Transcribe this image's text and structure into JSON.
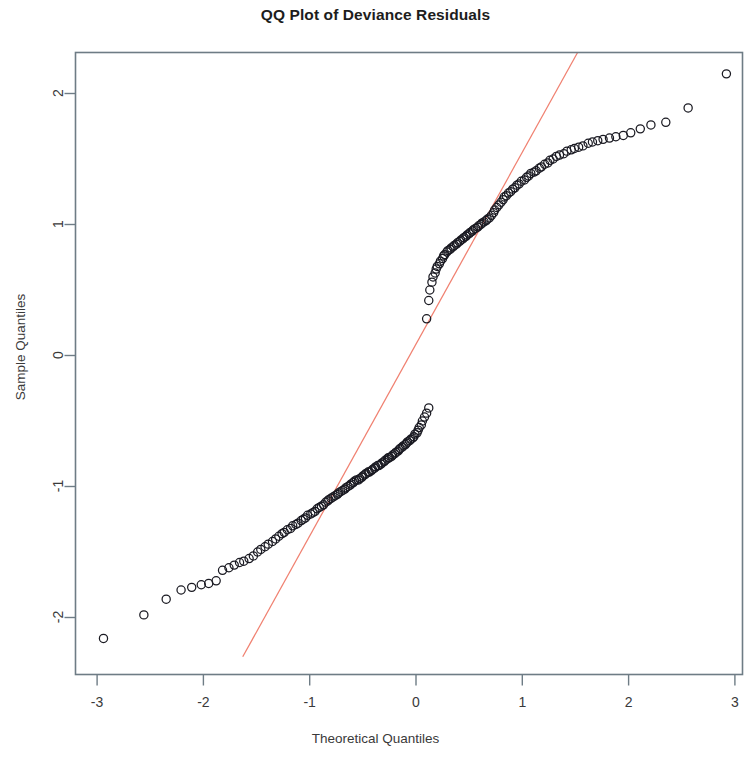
{
  "chart_data": {
    "type": "scatter",
    "title": "QQ Plot of Deviance Residuals",
    "xlabel": "Theoretical Quantiles",
    "ylabel": "Sample Quantiles",
    "xlim": [
      -3.2,
      3.15
    ],
    "ylim": [
      -2.3,
      2.32
    ],
    "xticks": [
      -3,
      -2,
      -1,
      0,
      1,
      2,
      3
    ],
    "xtick_labels": [
      "-3",
      "-2",
      "-1",
      "0",
      "1",
      "2",
      "3"
    ],
    "yticks": [
      -2,
      -1,
      0,
      1,
      2
    ],
    "ytick_labels": [
      "-2",
      "-1",
      "0",
      "1",
      "2"
    ],
    "grid": false,
    "legend": "none",
    "marker": "open-circle",
    "marker_color": "#1a1a22",
    "frame_color": "#6e7c85",
    "reference_line": {
      "name": "qqline",
      "color": "#f08070",
      "x": [
        -1.63,
        1.52
      ],
      "y": [
        -2.3,
        2.32
      ],
      "slope": 1.466,
      "intercept": 0.09
    },
    "series": [
      {
        "name": "Deviance residuals",
        "points": [
          [
            -2.94,
            -2.16
          ],
          [
            -2.56,
            -1.98
          ],
          [
            -2.35,
            -1.86
          ],
          [
            -2.21,
            -1.79
          ],
          [
            -2.11,
            -1.77
          ],
          [
            -2.02,
            -1.75
          ],
          [
            -1.95,
            -1.74
          ],
          [
            -1.88,
            -1.72
          ],
          [
            -1.82,
            -1.64
          ],
          [
            -1.76,
            -1.62
          ],
          [
            -1.71,
            -1.6
          ],
          [
            -1.66,
            -1.58
          ],
          [
            -1.62,
            -1.57
          ],
          [
            -1.57,
            -1.55
          ],
          [
            -1.53,
            -1.53
          ],
          [
            -1.49,
            -1.5
          ],
          [
            -1.46,
            -1.48
          ],
          [
            -1.42,
            -1.46
          ],
          [
            -1.39,
            -1.44
          ],
          [
            -1.35,
            -1.42
          ],
          [
            -1.32,
            -1.4
          ],
          [
            -1.29,
            -1.38
          ],
          [
            -1.26,
            -1.36
          ],
          [
            -1.24,
            -1.35
          ],
          [
            -1.21,
            -1.33
          ],
          [
            -1.18,
            -1.32
          ],
          [
            -1.16,
            -1.3
          ],
          [
            -1.13,
            -1.29
          ],
          [
            -1.11,
            -1.28
          ],
          [
            -1.08,
            -1.26
          ],
          [
            -1.06,
            -1.25
          ],
          [
            -1.04,
            -1.24
          ],
          [
            -1.02,
            -1.22
          ],
          [
            -0.99,
            -1.21
          ],
          [
            -0.97,
            -1.2
          ],
          [
            -0.95,
            -1.19
          ],
          [
            -0.93,
            -1.17
          ],
          [
            -0.91,
            -1.16
          ],
          [
            -0.89,
            -1.15
          ],
          [
            -0.87,
            -1.14
          ],
          [
            -0.85,
            -1.12
          ],
          [
            -0.83,
            -1.11
          ],
          [
            -0.82,
            -1.1
          ],
          [
            -0.8,
            -1.09
          ],
          [
            -0.78,
            -1.08
          ],
          [
            -0.76,
            -1.07
          ],
          [
            -0.74,
            -1.06
          ],
          [
            -0.73,
            -1.05
          ],
          [
            -0.71,
            -1.04
          ],
          [
            -0.69,
            -1.03
          ],
          [
            -0.67,
            -1.02
          ],
          [
            -0.66,
            -1.01
          ],
          [
            -0.64,
            -1.0
          ],
          [
            -0.62,
            -0.99
          ],
          [
            -0.61,
            -0.98
          ],
          [
            -0.59,
            -0.97
          ],
          [
            -0.58,
            -0.96
          ],
          [
            -0.56,
            -0.95
          ],
          [
            -0.54,
            -0.95
          ],
          [
            -0.53,
            -0.94
          ],
          [
            -0.51,
            -0.93
          ],
          [
            -0.5,
            -0.92
          ],
          [
            -0.48,
            -0.91
          ],
          [
            -0.47,
            -0.9
          ],
          [
            -0.45,
            -0.89
          ],
          [
            -0.44,
            -0.89
          ],
          [
            -0.42,
            -0.88
          ],
          [
            -0.41,
            -0.87
          ],
          [
            -0.39,
            -0.86
          ],
          [
            -0.38,
            -0.85
          ],
          [
            -0.36,
            -0.84
          ],
          [
            -0.35,
            -0.84
          ],
          [
            -0.33,
            -0.83
          ],
          [
            -0.32,
            -0.82
          ],
          [
            -0.3,
            -0.81
          ],
          [
            -0.29,
            -0.8
          ],
          [
            -0.27,
            -0.79
          ],
          [
            -0.26,
            -0.78
          ],
          [
            -0.25,
            -0.78
          ],
          [
            -0.23,
            -0.77
          ],
          [
            -0.22,
            -0.76
          ],
          [
            -0.2,
            -0.75
          ],
          [
            -0.19,
            -0.74
          ],
          [
            -0.17,
            -0.73
          ],
          [
            -0.16,
            -0.72
          ],
          [
            -0.15,
            -0.71
          ],
          [
            -0.13,
            -0.7
          ],
          [
            -0.12,
            -0.69
          ],
          [
            -0.1,
            -0.68
          ],
          [
            -0.09,
            -0.67
          ],
          [
            -0.08,
            -0.66
          ],
          [
            -0.06,
            -0.65
          ],
          [
            -0.05,
            -0.64
          ],
          [
            -0.03,
            -0.63
          ],
          [
            -0.02,
            -0.62
          ],
          [
            -0.01,
            -0.6
          ],
          [
            0.01,
            -0.59
          ],
          [
            0.02,
            -0.57
          ],
          [
            0.03,
            -0.55
          ],
          [
            0.05,
            -0.53
          ],
          [
            0.06,
            -0.5
          ],
          [
            0.08,
            -0.47
          ],
          [
            0.1,
            -0.44
          ],
          [
            0.12,
            -0.4
          ],
          [
            0.1,
            0.28
          ],
          [
            0.12,
            0.42
          ],
          [
            0.13,
            0.5
          ],
          [
            0.15,
            0.56
          ],
          [
            0.16,
            0.6
          ],
          [
            0.18,
            0.63
          ],
          [
            0.19,
            0.66
          ],
          [
            0.2,
            0.68
          ],
          [
            0.22,
            0.7
          ],
          [
            0.23,
            0.72
          ],
          [
            0.25,
            0.74
          ],
          [
            0.26,
            0.76
          ],
          [
            0.27,
            0.77
          ],
          [
            0.29,
            0.79
          ],
          [
            0.3,
            0.8
          ],
          [
            0.32,
            0.81
          ],
          [
            0.33,
            0.82
          ],
          [
            0.35,
            0.83
          ],
          [
            0.36,
            0.84
          ],
          [
            0.38,
            0.85
          ],
          [
            0.39,
            0.86
          ],
          [
            0.41,
            0.87
          ],
          [
            0.42,
            0.88
          ],
          [
            0.44,
            0.89
          ],
          [
            0.45,
            0.9
          ],
          [
            0.47,
            0.91
          ],
          [
            0.48,
            0.92
          ],
          [
            0.5,
            0.93
          ],
          [
            0.51,
            0.94
          ],
          [
            0.53,
            0.95
          ],
          [
            0.54,
            0.96
          ],
          [
            0.56,
            0.97
          ],
          [
            0.58,
            0.98
          ],
          [
            0.59,
            0.99
          ],
          [
            0.61,
            1.0
          ],
          [
            0.62,
            1.01
          ],
          [
            0.64,
            1.02
          ],
          [
            0.66,
            1.03
          ],
          [
            0.67,
            1.04
          ],
          [
            0.69,
            1.05
          ],
          [
            0.71,
            1.07
          ],
          [
            0.73,
            1.09
          ],
          [
            0.74,
            1.11
          ],
          [
            0.76,
            1.13
          ],
          [
            0.78,
            1.15
          ],
          [
            0.8,
            1.17
          ],
          [
            0.82,
            1.19
          ],
          [
            0.83,
            1.21
          ],
          [
            0.85,
            1.22
          ],
          [
            0.87,
            1.24
          ],
          [
            0.89,
            1.25
          ],
          [
            0.91,
            1.27
          ],
          [
            0.93,
            1.28
          ],
          [
            0.95,
            1.3
          ],
          [
            0.97,
            1.31
          ],
          [
            0.99,
            1.33
          ],
          [
            1.02,
            1.34
          ],
          [
            1.04,
            1.36
          ],
          [
            1.06,
            1.37
          ],
          [
            1.08,
            1.39
          ],
          [
            1.11,
            1.4
          ],
          [
            1.13,
            1.41
          ],
          [
            1.16,
            1.43
          ],
          [
            1.18,
            1.44
          ],
          [
            1.21,
            1.46
          ],
          [
            1.24,
            1.47
          ],
          [
            1.26,
            1.49
          ],
          [
            1.29,
            1.5
          ],
          [
            1.32,
            1.52
          ],
          [
            1.35,
            1.53
          ],
          [
            1.39,
            1.54
          ],
          [
            1.42,
            1.56
          ],
          [
            1.46,
            1.57
          ],
          [
            1.49,
            1.58
          ],
          [
            1.53,
            1.59
          ],
          [
            1.57,
            1.6
          ],
          [
            1.62,
            1.62
          ],
          [
            1.66,
            1.63
          ],
          [
            1.71,
            1.64
          ],
          [
            1.76,
            1.65
          ],
          [
            1.82,
            1.66
          ],
          [
            1.88,
            1.67
          ],
          [
            1.95,
            1.68
          ],
          [
            2.02,
            1.7
          ],
          [
            2.11,
            1.73
          ],
          [
            2.21,
            1.76
          ],
          [
            2.35,
            1.78
          ],
          [
            2.56,
            1.89
          ],
          [
            2.92,
            2.15
          ]
        ]
      }
    ]
  },
  "axes": {
    "title": "QQ Plot of Deviance Residuals",
    "xlabel": "Theoretical Quantiles",
    "ylabel": "Sample Quantiles"
  }
}
